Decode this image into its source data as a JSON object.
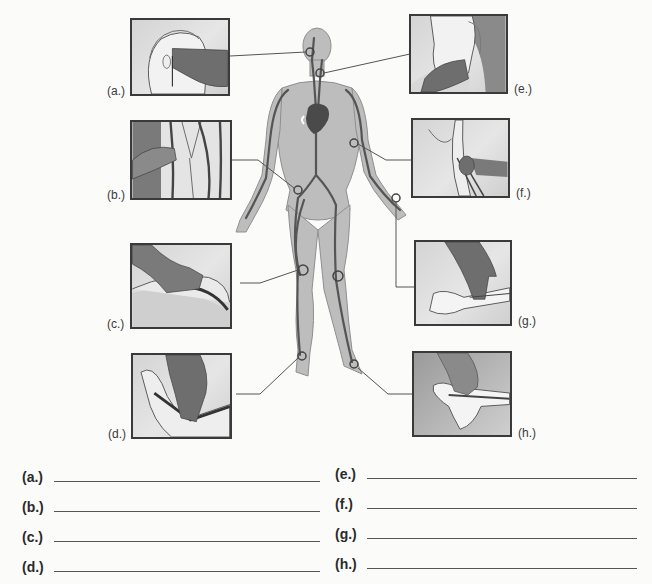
{
  "diagram": {
    "figure": "human-body-circulatory-outline",
    "colors": {
      "body_fill": "#bdbdbd",
      "body_outline": "#8a8a8a",
      "vessel": "#555555",
      "heart": "#4a4a4a",
      "panel_border": "#3a3a3a",
      "hand_dark": "#6e6e6e",
      "leader_line": "#555555"
    },
    "panels": [
      {
        "id": "a",
        "label": "(a.)",
        "depicts": "hand feeling pulse at temple"
      },
      {
        "id": "b",
        "label": "(b.)",
        "depicts": "hand feeling pulse at groin"
      },
      {
        "id": "c",
        "label": "(c.)",
        "depicts": "hand feeling pulse behind knee"
      },
      {
        "id": "d",
        "label": "(d.)",
        "depicts": "hand feeling pulse at inner ankle"
      },
      {
        "id": "e",
        "label": "(e.)",
        "depicts": "hand feeling pulse at neck"
      },
      {
        "id": "f",
        "label": "(f.)",
        "depicts": "hand feeling pulse at inner elbow"
      },
      {
        "id": "g",
        "label": "(g.)",
        "depicts": "fingers feeling pulse at wrist"
      },
      {
        "id": "h",
        "label": "(h.)",
        "depicts": "hand feeling pulse on top of foot"
      }
    ]
  },
  "answers": {
    "left": [
      {
        "label": "(a.)",
        "value": ""
      },
      {
        "label": "(b.)",
        "value": ""
      },
      {
        "label": "(c.)",
        "value": ""
      },
      {
        "label": "(d.)",
        "value": ""
      }
    ],
    "right": [
      {
        "label": "(e.)",
        "value": ""
      },
      {
        "label": "(f.)",
        "value": ""
      },
      {
        "label": "(g.)",
        "value": ""
      },
      {
        "label": "(h.)",
        "value": ""
      }
    ]
  }
}
